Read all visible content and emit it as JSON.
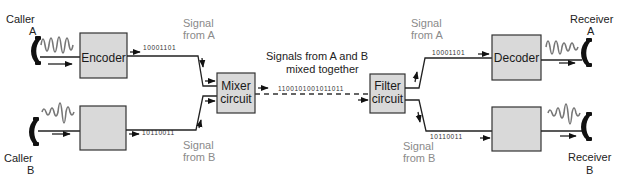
{
  "diagram": {
    "colors": {
      "box_fill": "#d9d9d9",
      "line": "#222222",
      "wave": "#777777",
      "muted_text": "#8a8a8a"
    },
    "callers": [
      {
        "id": "caller-a",
        "label_line1": "Caller",
        "label_line2": "A",
        "icon": "telephone-handset-icon"
      },
      {
        "id": "caller-b",
        "label_line1": "Caller",
        "label_line2": "B",
        "icon": "telephone-handset-icon"
      }
    ],
    "receivers": [
      {
        "id": "receiver-a",
        "label_line1": "Receiver",
        "label_line2": "A",
        "icon": "telephone-handset-icon"
      },
      {
        "id": "receiver-b",
        "label_line1": "Receiver",
        "label_line2": "B",
        "icon": "telephone-handset-icon"
      }
    ],
    "boxes": {
      "encoder": {
        "label": "Encoder"
      },
      "encoder_b": {
        "label": ""
      },
      "mixer": {
        "label_line1": "Mixer",
        "label_line2": "circuit"
      },
      "filter": {
        "label_line1": "Filter",
        "label_line2": "circuit"
      },
      "decoder": {
        "label": "Decoder"
      },
      "decoder_b": {
        "label": ""
      }
    },
    "bit_streams": {
      "a_in": "10001101",
      "b_in": "10110011",
      "mixed": "1100101001011011",
      "a_out": "10001101",
      "b_out": "10110011"
    },
    "annotations": {
      "signal_a_left_line1": "Signal",
      "signal_a_left_line2": "from A",
      "signal_b_left_line1": "Signal",
      "signal_b_left_line2": "from B",
      "mixed_line1": "Signals from A and B",
      "mixed_line2": "mixed together",
      "signal_a_right_line1": "Signal",
      "signal_a_right_line2": "from A",
      "signal_b_right_line1": "Signal",
      "signal_b_right_line2": "from B"
    }
  }
}
